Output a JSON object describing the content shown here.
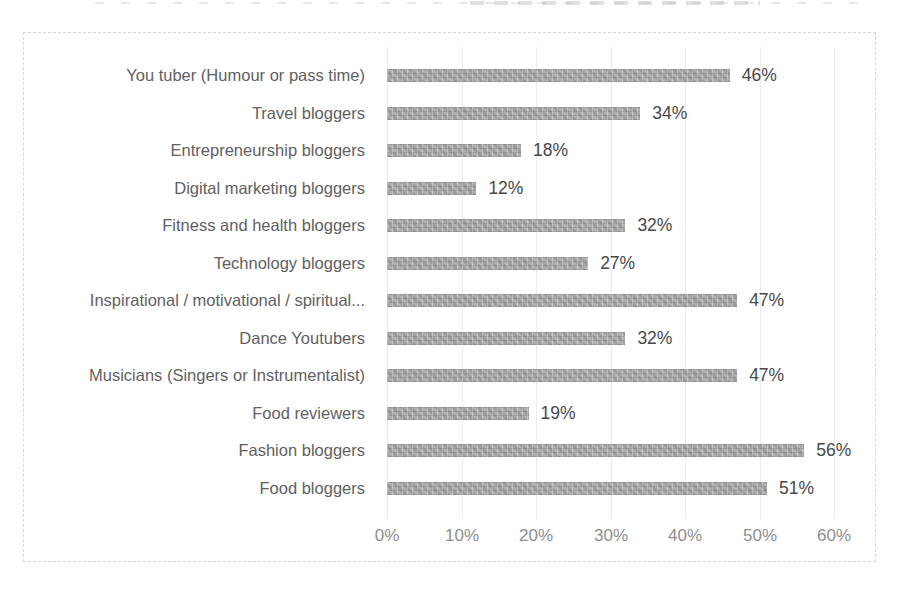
{
  "chart_data": {
    "type": "bar",
    "orientation": "horizontal",
    "title": "",
    "xlabel": "",
    "ylabel": "",
    "categories": [
      "You tuber (Humour or pass time)",
      "Travel bloggers",
      "Entrepreneurship bloggers",
      "Digital marketing bloggers",
      "Fitness and health bloggers",
      "Technology bloggers",
      "Inspirational / motivational / spiritual...",
      "Dance Youtubers",
      "Musicians (Singers or Instrumentalist)",
      "Food reviewers",
      "Fashion bloggers",
      "Food bloggers"
    ],
    "values": [
      46,
      34,
      18,
      12,
      32,
      27,
      47,
      32,
      47,
      19,
      56,
      51
    ],
    "value_labels": [
      "46%",
      "34%",
      "18%",
      "12%",
      "32%",
      "27%",
      "47%",
      "32%",
      "47%",
      "19%",
      "56%",
      "51%"
    ],
    "x_ticks": [
      "0%",
      "10%",
      "20%",
      "30%",
      "40%",
      "50%",
      "60%"
    ],
    "xlim": [
      0,
      60
    ],
    "grid": true,
    "legend": false,
    "colors": {
      "bar": "#a7a7a7",
      "category_label": "#616161",
      "value_label": "#484848",
      "tick_label": "#8e8e8e",
      "gridline": "#ededed",
      "frame_border": "#d6d6d6"
    }
  }
}
